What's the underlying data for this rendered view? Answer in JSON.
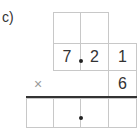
{
  "problem": {
    "label": "c)",
    "operator": "×",
    "row1": [
      "",
      ""
    ],
    "row2": [
      "7",
      "2",
      "1"
    ],
    "multiplier": "6",
    "result": [
      "",
      "",
      "",
      ""
    ],
    "decimal_point": "."
  },
  "colors": {
    "grid": "#c8c8c8",
    "text": "#333333",
    "rule": "#333333",
    "operator": "#999999"
  }
}
